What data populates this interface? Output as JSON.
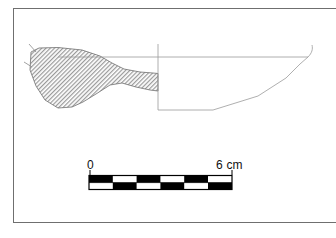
{
  "figure": {
    "kind": "archaeological-profile-drawing",
    "frame": {
      "stroke_color": "#6f6f6f",
      "fill_color": "#ffffff"
    }
  },
  "drawing": {
    "line_color": "#8a8a8a",
    "section_line_color": "#5a5a5a",
    "section_hatch_color": "#9a9a9a",
    "section_hatch_background": "#ffffff",
    "centerline_label": "vessel centre axis",
    "sections": [
      {
        "name": "hatched-cross-section",
        "description": "shaded wall cross-section at left"
      },
      {
        "name": "profile-outline",
        "description": "exterior profile of vessel body at right"
      }
    ]
  },
  "scalebar": {
    "label_zero": "0",
    "label_max": "6 cm",
    "units": "cm",
    "min_value": 0,
    "max_value": 6,
    "segment_count": 6,
    "segment_value": 1,
    "fill_dark": "#000000",
    "fill_light": "#ffffff",
    "stroke_color": "#000000",
    "top_row_start": "dark",
    "bottom_row_start": "light"
  }
}
